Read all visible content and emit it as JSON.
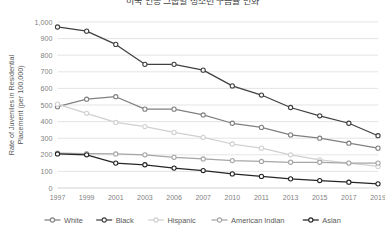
{
  "chart_data": {
    "type": "line",
    "title": "미국 인종 그룹별 청소년 구금률 변화",
    "xlabel": "",
    "ylabel": "Rate of Juveniles in Residential Placement (per 100,000)",
    "categories": [
      "1997",
      "1999",
      "2001",
      "2003",
      "2006",
      "2007",
      "2010",
      "2011",
      "2013",
      "2015",
      "2017",
      "2019"
    ],
    "ylim": [
      0,
      1000
    ],
    "ytick_values": [
      0,
      100,
      200,
      300,
      400,
      500,
      600,
      700,
      800,
      900,
      1000
    ],
    "ytick_labels": [
      "0",
      "100",
      "200",
      "300",
      "400",
      "500",
      "600",
      "700",
      "800",
      "900",
      "1,000"
    ],
    "grid": true,
    "legend_position": "bottom",
    "series": [
      {
        "name": "White",
        "color": "#808080",
        "marker": "circle-open",
        "values": [
          490,
          535,
          550,
          475,
          475,
          440,
          390,
          365,
          320,
          300,
          270,
          240
        ]
      },
      {
        "name": "Black",
        "color": "#404040",
        "marker": "circle-open",
        "values": [
          970,
          945,
          865,
          745,
          745,
          710,
          615,
          560,
          485,
          435,
          390,
          315
        ]
      },
      {
        "name": "Hispanic",
        "color": "#d0d0d0",
        "marker": "circle-open",
        "values": [
          505,
          450,
          395,
          370,
          335,
          305,
          265,
          240,
          200,
          170,
          150,
          130
        ]
      },
      {
        "name": "American Indian",
        "color": "#a6a6a6",
        "marker": "circle-open",
        "values": [
          210,
          207,
          205,
          200,
          185,
          175,
          165,
          160,
          155,
          155,
          150,
          150
        ]
      },
      {
        "name": "Asian",
        "color": "#262626",
        "marker": "circle-open",
        "values": [
          205,
          200,
          150,
          140,
          120,
          105,
          85,
          70,
          55,
          45,
          35,
          25
        ]
      }
    ]
  }
}
